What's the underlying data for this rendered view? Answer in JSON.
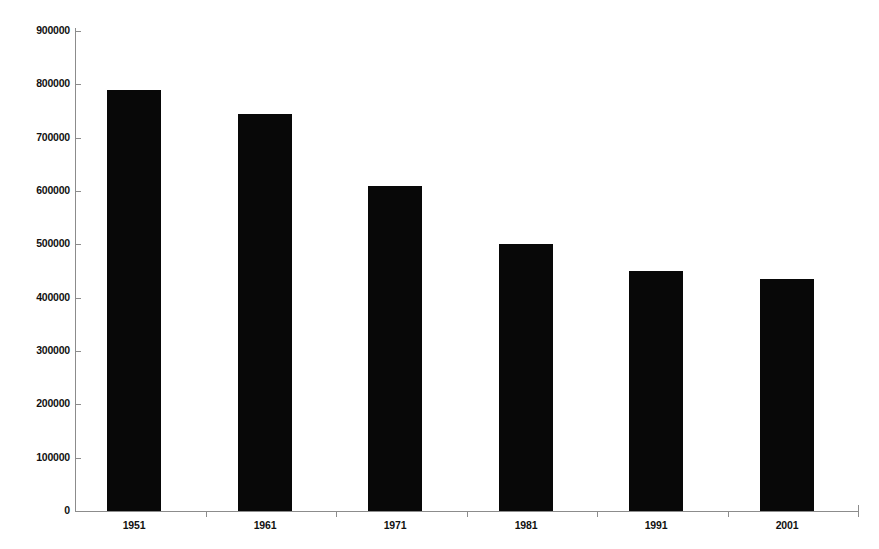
{
  "chart_data": {
    "type": "bar",
    "title": "",
    "subtitle": "",
    "xlabel": "",
    "ylabel": "",
    "categories": [
      "1951",
      "1961",
      "1971",
      "1981",
      "1991",
      "2001"
    ],
    "values": [
      790000,
      745000,
      610000,
      500000,
      450000,
      435000
    ],
    "series": [
      {
        "name": "",
        "values": [
          790000,
          745000,
          610000,
          500000,
          450000,
          435000
        ]
      }
    ],
    "ylim": [
      0,
      900000
    ],
    "ytick_labels": [
      "0",
      "100000",
      "200000",
      "300000",
      "400000",
      "500000",
      "600000",
      "700000",
      "800000",
      "900000"
    ],
    "ytick_values": [
      0,
      100000,
      200000,
      300000,
      400000,
      500000,
      600000,
      700000,
      800000,
      900000
    ],
    "xtick_labels": [
      "1951",
      "1961",
      "1971",
      "1981",
      "1991",
      "2001"
    ],
    "grid": false,
    "legend": false,
    "legend_position": "none",
    "bar_color": "#080808",
    "axis_color": "#8c8c8c",
    "background_color": "#ffffff",
    "annotations": []
  }
}
